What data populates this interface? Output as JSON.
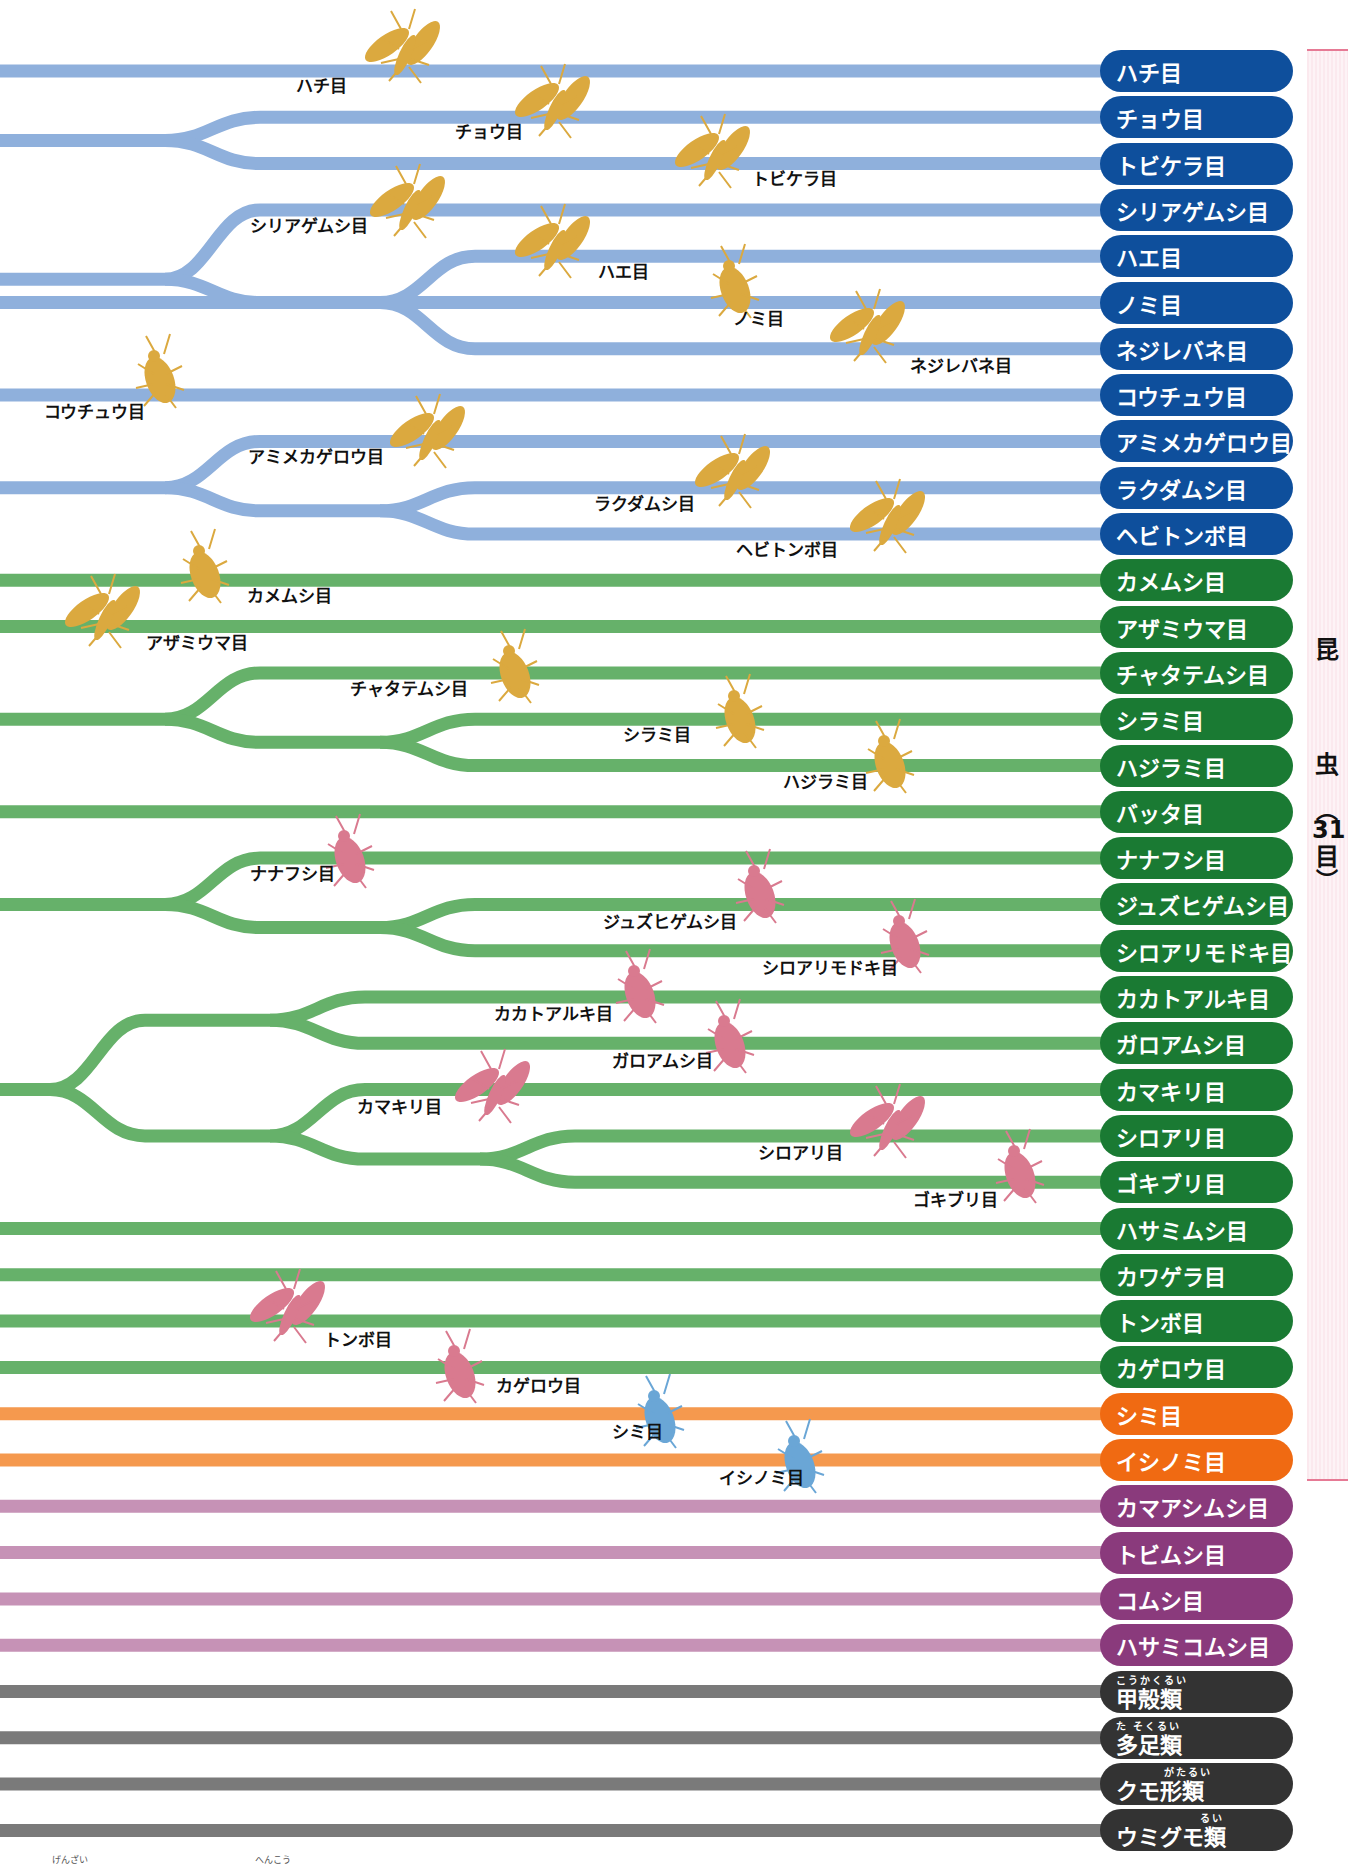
{
  "bracket": {
    "chars": [
      "昆",
      "虫"
    ],
    "paren_open": "︵",
    "count": "31",
    "count_unit": "目",
    "paren_close": "︶",
    "color": "#e67a95"
  },
  "layout": {
    "row_start_y": 71,
    "row_spacing": 46.3,
    "line_width": 13,
    "line_end_x": 1110
  },
  "groups": {
    "blue": {
      "line": "#8fb0dc",
      "pill": "#0e4f9c"
    },
    "green": {
      "line": "#66b16a",
      "pill": "#1a7a33"
    },
    "orange": {
      "line": "#f5994e",
      "pill": "#f06a12"
    },
    "purple": {
      "line": "#c692b6",
      "pill": "#8a3a7c"
    },
    "gray": {
      "line": "#7a7a7a",
      "pill": "#333333"
    },
    "silhouette_gold": "#dba93f",
    "silhouette_pink": "#d97a8f",
    "silhouette_lightblue": "#6aa6d6"
  },
  "rows": [
    {
      "name": "ハチ目",
      "group": "blue"
    },
    {
      "name": "チョウ目",
      "group": "blue"
    },
    {
      "name": "トビケラ目",
      "group": "blue"
    },
    {
      "name": "シリアゲムシ目",
      "group": "blue"
    },
    {
      "name": "ハエ目",
      "group": "blue"
    },
    {
      "name": "ノミ目",
      "group": "blue"
    },
    {
      "name": "ネジレバネ目",
      "group": "blue"
    },
    {
      "name": "コウチュウ目",
      "group": "blue"
    },
    {
      "name": "アミメカゲロウ目",
      "group": "blue"
    },
    {
      "name": "ラクダムシ目",
      "group": "blue"
    },
    {
      "name": "ヘビトンボ目",
      "group": "blue"
    },
    {
      "name": "カメムシ目",
      "group": "green"
    },
    {
      "name": "アザミウマ目",
      "group": "green"
    },
    {
      "name": "チャタテムシ目",
      "group": "green"
    },
    {
      "name": "シラミ目",
      "group": "green"
    },
    {
      "name": "ハジラミ目",
      "group": "green"
    },
    {
      "name": "バッタ目",
      "group": "green"
    },
    {
      "name": "ナナフシ目",
      "group": "green"
    },
    {
      "name": "ジュズヒゲムシ目",
      "group": "green"
    },
    {
      "name": "シロアリモドキ目",
      "group": "green"
    },
    {
      "name": "カカトアルキ目",
      "group": "green"
    },
    {
      "name": "ガロアムシ目",
      "group": "green"
    },
    {
      "name": "カマキリ目",
      "group": "green"
    },
    {
      "name": "シロアリ目",
      "group": "green"
    },
    {
      "name": "ゴキブリ目",
      "group": "green"
    },
    {
      "name": "ハサミムシ目",
      "group": "green"
    },
    {
      "name": "カワゲラ目",
      "group": "green"
    },
    {
      "name": "トンボ目",
      "group": "green"
    },
    {
      "name": "カゲロウ目",
      "group": "green"
    },
    {
      "name": "シミ目",
      "group": "orange"
    },
    {
      "name": "イシノミ目",
      "group": "orange"
    },
    {
      "name": "カマアシムシ目",
      "group": "purple"
    },
    {
      "name": "トビムシ目",
      "group": "purple"
    },
    {
      "name": "コムシ目",
      "group": "purple"
    },
    {
      "name": "ハサミコムシ目",
      "group": "purple"
    },
    {
      "name": "甲殻類",
      "group": "gray",
      "ruby": "こうかくるい"
    },
    {
      "name": "多足類",
      "group": "gray",
      "ruby": "た そくるい"
    },
    {
      "name": "クモ形類",
      "group": "gray",
      "ruby": "がたるい",
      "ruby_offset": 48
    },
    {
      "name": "ウミグモ類",
      "group": "gray",
      "ruby": "るい",
      "ruby_offset": 84
    }
  ],
  "branches": [
    {
      "group": "blue",
      "from": [
        1,
        2
      ],
      "split_x": 165
    },
    {
      "group": "blue",
      "from": [
        3,
        6
      ],
      "split_x": 165,
      "children": [
        3,
        [
          4,
          6
        ]
      ]
    },
    {
      "group": "blue",
      "from": [
        4,
        6
      ],
      "split_x": 380
    },
    {
      "group": "blue",
      "from": [
        8,
        10
      ],
      "split_x": 165,
      "children": [
        8,
        [
          9,
          10
        ]
      ]
    },
    {
      "group": "blue",
      "from": [
        9,
        10
      ],
      "split_x": 380
    },
    {
      "group": "green",
      "from": [
        13,
        15
      ],
      "split_x": 165,
      "children": [
        13,
        [
          14,
          15
        ]
      ]
    },
    {
      "group": "green",
      "from": [
        14,
        15
      ],
      "split_x": 380
    },
    {
      "group": "green",
      "from": [
        17,
        19
      ],
      "split_x": 165,
      "children": [
        17,
        [
          18,
          19
        ]
      ]
    },
    {
      "group": "green",
      "from": [
        18,
        19
      ],
      "split_x": 380
    },
    {
      "group": "green",
      "from": [
        20,
        24
      ],
      "split_x": 50,
      "children": [
        [
          20,
          21
        ],
        [
          22,
          24
        ]
      ]
    },
    {
      "group": "green",
      "from": [
        20,
        21
      ],
      "split_x": 270
    },
    {
      "group": "green",
      "from": [
        22,
        24
      ],
      "split_x": 270,
      "children": [
        22,
        [
          23,
          24
        ]
      ]
    },
    {
      "group": "green",
      "from": [
        23,
        24
      ],
      "split_x": 480
    }
  ],
  "order_labels": [
    {
      "text": "ハチ目",
      "x": 296,
      "y": 82
    },
    {
      "text": "チョウ目",
      "x": 455,
      "y": 128
    },
    {
      "text": "トビケラ目",
      "x": 752,
      "y": 175
    },
    {
      "text": "シリアゲムシ目",
      "x": 250,
      "y": 222
    },
    {
      "text": "ハエ目",
      "x": 598,
      "y": 268
    },
    {
      "text": "ノミ目",
      "x": 733,
      "y": 315
    },
    {
      "text": "ネジレバネ目",
      "x": 910,
      "y": 362
    },
    {
      "text": "コウチュウ目",
      "x": 44,
      "y": 408
    },
    {
      "text": "アミメカゲロウ目",
      "x": 248,
      "y": 453
    },
    {
      "text": "ラクダムシ目",
      "x": 594,
      "y": 500
    },
    {
      "text": "ヘビトンボ目",
      "x": 736,
      "y": 546
    },
    {
      "text": "カメムシ目",
      "x": 247,
      "y": 592
    },
    {
      "text": "アザミウマ目",
      "x": 146,
      "y": 639
    },
    {
      "text": "チャタテムシ目",
      "x": 350,
      "y": 685
    },
    {
      "text": "シラミ目",
      "x": 623,
      "y": 731
    },
    {
      "text": "ハジラミ目",
      "x": 783,
      "y": 778
    },
    {
      "text": "ナナフシ目",
      "x": 250,
      "y": 870
    },
    {
      "text": "ジュズヒゲムシ目",
      "x": 603,
      "y": 918
    },
    {
      "text": "シロアリモドキ目",
      "x": 762,
      "y": 964
    },
    {
      "text": "カカトアルキ目",
      "x": 494,
      "y": 1010
    },
    {
      "text": "ガロアムシ目",
      "x": 612,
      "y": 1057
    },
    {
      "text": "カマキリ目",
      "x": 357,
      "y": 1103
    },
    {
      "text": "シロアリ目",
      "x": 758,
      "y": 1149
    },
    {
      "text": "ゴキブリ目",
      "x": 913,
      "y": 1196
    },
    {
      "text": "トンボ目",
      "x": 324,
      "y": 1336
    },
    {
      "text": "カゲロウ目",
      "x": 496,
      "y": 1382
    },
    {
      "text": "シミ目",
      "x": 612,
      "y": 1428
    },
    {
      "text": "イシノミ目",
      "x": 719,
      "y": 1474
    }
  ],
  "silhouettes": [
    {
      "kind": "wasp",
      "x": 405,
      "y": 55,
      "color": "gold"
    },
    {
      "kind": "butterfly",
      "x": 555,
      "y": 110,
      "color": "gold"
    },
    {
      "kind": "moth",
      "x": 715,
      "y": 160,
      "color": "gold"
    },
    {
      "kind": "scorpionfly",
      "x": 410,
      "y": 210,
      "color": "gold"
    },
    {
      "kind": "fly",
      "x": 555,
      "y": 250,
      "color": "gold"
    },
    {
      "kind": "flea",
      "x": 735,
      "y": 290,
      "color": "gold"
    },
    {
      "kind": "strepsiptera",
      "x": 870,
      "y": 335,
      "color": "gold"
    },
    {
      "kind": "beetle",
      "x": 160,
      "y": 380,
      "color": "gold"
    },
    {
      "kind": "lacewing",
      "x": 430,
      "y": 440,
      "color": "gold"
    },
    {
      "kind": "snakefly",
      "x": 735,
      "y": 480,
      "color": "gold"
    },
    {
      "kind": "dobsonfly",
      "x": 890,
      "y": 525,
      "color": "gold"
    },
    {
      "kind": "stinkbug",
      "x": 205,
      "y": 575,
      "color": "gold"
    },
    {
      "kind": "thrips",
      "x": 105,
      "y": 620,
      "color": "gold"
    },
    {
      "kind": "barklouse",
      "x": 515,
      "y": 675,
      "color": "gold"
    },
    {
      "kind": "louse",
      "x": 740,
      "y": 720,
      "color": "gold"
    },
    {
      "kind": "chewinglouse",
      "x": 890,
      "y": 765,
      "color": "gold"
    },
    {
      "kind": "stickinsect",
      "x": 350,
      "y": 860,
      "color": "pink"
    },
    {
      "kind": "zoraptera",
      "x": 760,
      "y": 895,
      "color": "pink"
    },
    {
      "kind": "webspinner",
      "x": 905,
      "y": 945,
      "color": "pink"
    },
    {
      "kind": "heelwalker",
      "x": 640,
      "y": 995,
      "color": "pink"
    },
    {
      "kind": "icecrawler",
      "x": 730,
      "y": 1045,
      "color": "pink"
    },
    {
      "kind": "mantis",
      "x": 495,
      "y": 1095,
      "color": "pink"
    },
    {
      "kind": "termite",
      "x": 890,
      "y": 1130,
      "color": "pink"
    },
    {
      "kind": "cockroach",
      "x": 1020,
      "y": 1175,
      "color": "pink"
    },
    {
      "kind": "dragonfly",
      "x": 290,
      "y": 1315,
      "color": "pink"
    },
    {
      "kind": "mayfly",
      "x": 460,
      "y": 1375,
      "color": "pink"
    },
    {
      "kind": "silverfish",
      "x": 660,
      "y": 1420,
      "color": "lightblue"
    },
    {
      "kind": "bristletail",
      "x": 800,
      "y": 1465,
      "color": "lightblue"
    }
  ],
  "footer": {
    "furigana_left": "げんざい",
    "furigana_right": "へんこう"
  }
}
